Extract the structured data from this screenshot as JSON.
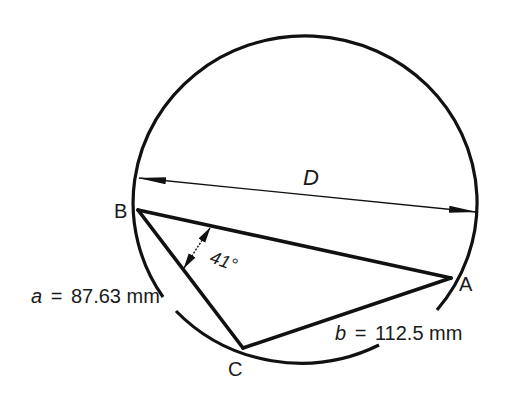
{
  "figure": {
    "type": "inscribed-triangle-in-circle",
    "stroke_color": "#111111",
    "background_color": "#ffffff"
  },
  "circle": {
    "label": "circumscribed circle",
    "diameter_label": "D"
  },
  "vertices": {
    "A": "A",
    "B": "B",
    "C": "C"
  },
  "dimensions": {
    "a": {
      "variable": "a",
      "equals": "=",
      "value": "87.63 mm"
    },
    "b": {
      "variable": "b",
      "equals": "=",
      "value": "112.5 mm"
    },
    "angle": {
      "value": "41°",
      "at_vertex": "B"
    }
  }
}
